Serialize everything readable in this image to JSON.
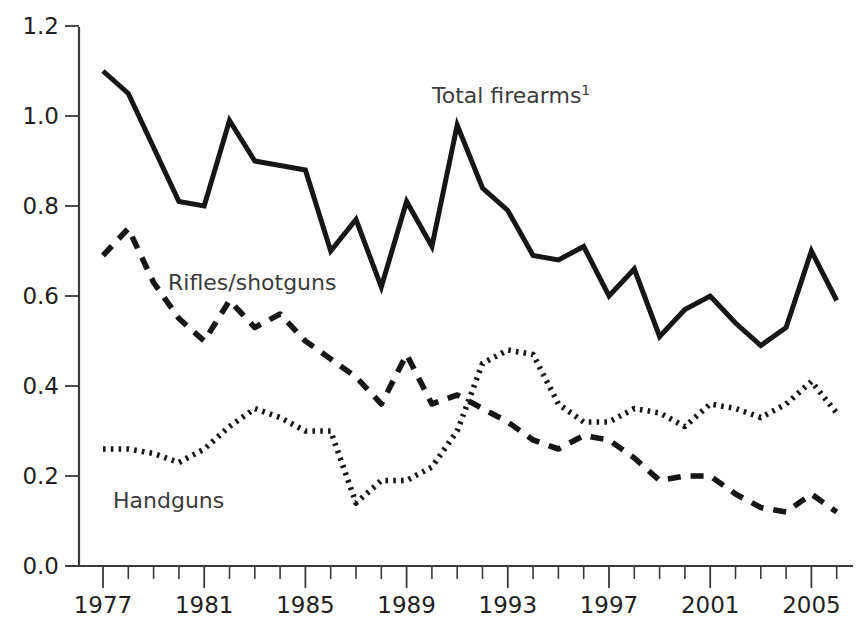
{
  "chart_data": {
    "type": "line",
    "title": "",
    "subtitle": "",
    "xlabel": "",
    "ylabel": "",
    "xlim": [
      1976.5,
      2006.5
    ],
    "ylim": [
      0.0,
      1.2
    ],
    "grid": false,
    "legend_position": "inline-annotations",
    "y_ticks": [
      "1.2",
      "1.0",
      "0.8",
      "0.6",
      "0.4",
      "0.2",
      "0.0"
    ],
    "y_tick_values": [
      1.2,
      1.0,
      0.8,
      0.6,
      0.4,
      0.2,
      0.0
    ],
    "x_ticks_labeled": [
      "1977",
      "1981",
      "1985",
      "1989",
      "1993",
      "1997",
      "2001",
      "2005"
    ],
    "x_tick_label_values": [
      1977,
      1981,
      1985,
      1989,
      1993,
      1997,
      2001,
      2005
    ],
    "x_all_tick_values": [
      1977,
      1978,
      1979,
      1980,
      1981,
      1982,
      1983,
      1984,
      1985,
      1986,
      1987,
      1988,
      1989,
      1990,
      1991,
      1992,
      1993,
      1994,
      1995,
      1996,
      1997,
      1998,
      1999,
      2000,
      2001,
      2002,
      2003,
      2004,
      2005,
      2006
    ],
    "x": [
      1977,
      1978,
      1979,
      1980,
      1981,
      1982,
      1983,
      1984,
      1985,
      1986,
      1987,
      1988,
      1989,
      1990,
      1991,
      1992,
      1993,
      1994,
      1995,
      1996,
      1997,
      1998,
      1999,
      2000,
      2001,
      2002,
      2003,
      2004,
      2005,
      2006
    ],
    "series": [
      {
        "name": "Total firearms",
        "label": "Total firearms",
        "label_superscript": "1",
        "style": "solid",
        "color": "#161616",
        "values": [
          1.1,
          1.05,
          0.93,
          0.81,
          0.8,
          0.99,
          0.9,
          0.89,
          0.88,
          0.7,
          0.77,
          0.62,
          0.81,
          0.71,
          0.98,
          0.84,
          0.79,
          0.69,
          0.68,
          0.71,
          0.6,
          0.66,
          0.51,
          0.57,
          0.6,
          0.54,
          0.49,
          0.53,
          0.7,
          0.59
        ]
      },
      {
        "name": "Rifles/shotguns",
        "label": "Rifles/shotguns",
        "style": "dashed",
        "color": "#161616",
        "values": [
          0.69,
          0.75,
          0.63,
          0.55,
          0.5,
          0.59,
          0.53,
          0.56,
          0.5,
          0.46,
          0.42,
          0.36,
          0.47,
          0.36,
          0.38,
          0.35,
          0.32,
          0.28,
          0.26,
          0.29,
          0.28,
          0.24,
          0.19,
          0.2,
          0.2,
          0.16,
          0.13,
          0.12,
          0.16,
          0.12
        ]
      },
      {
        "name": "Handguns",
        "label": "Handguns",
        "style": "dotted",
        "color": "#161616",
        "values": [
          0.26,
          0.26,
          0.25,
          0.23,
          0.26,
          0.31,
          0.35,
          0.33,
          0.3,
          0.3,
          0.14,
          0.19,
          0.19,
          0.22,
          0.3,
          0.45,
          0.48,
          0.47,
          0.36,
          0.32,
          0.32,
          0.35,
          0.34,
          0.31,
          0.36,
          0.35,
          0.33,
          0.36,
          0.41,
          0.34
        ]
      }
    ],
    "annotations": [
      {
        "text": "Total firearms",
        "superscript": "1",
        "x_px": 432,
        "y_px": 103
      },
      {
        "text": "Rifles/shotguns",
        "x_px": 168,
        "y_px": 290
      },
      {
        "text": "Handguns",
        "x_px": 113,
        "y_px": 508
      }
    ]
  }
}
